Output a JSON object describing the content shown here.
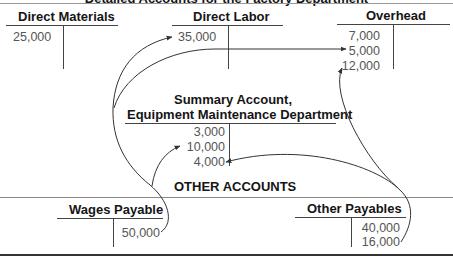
{
  "diagram": {
    "title": "Detailed Accounts for the Factory Department",
    "detailed_accounts": [
      {
        "name": "Direct Materials",
        "debits": [
          "25,000"
        ],
        "credits": []
      },
      {
        "name": "Direct Labor",
        "debits": [
          "35,000"
        ],
        "credits": []
      },
      {
        "name": "Overhead",
        "debits": [
          "7,000",
          "5,000",
          "12,000"
        ],
        "credits": []
      }
    ],
    "summary_account": {
      "title_line1": "Summary Account,",
      "title_line2": "Equipment Maintenance Department",
      "debits": [
        "3,000",
        "10,000",
        "4,000"
      ],
      "credits": []
    },
    "section_label": "OTHER ACCOUNTS",
    "other_accounts": [
      {
        "name": "Wages Payable",
        "debits": [],
        "credits": [
          "50,000"
        ]
      },
      {
        "name": "Other Payables",
        "debits": [],
        "credits": [
          "40,000",
          "16,000"
        ]
      }
    ],
    "flows": [
      {
        "from": "Wages Payable 50,000",
        "to": "Direct Labor 35,000"
      },
      {
        "from": "Wages Payable 50,000",
        "to": "Overhead 5,000"
      },
      {
        "from": "Wages Payable 50,000",
        "to": "Summary Account 10,000"
      },
      {
        "from": "Other Payables 16,000",
        "to": "Summary Account 4,000"
      },
      {
        "from": "Other Payables 16,000",
        "to": "Overhead 12,000"
      }
    ],
    "colors": {
      "lines": "#444444",
      "text": "#151515",
      "values": "#555555"
    }
  }
}
